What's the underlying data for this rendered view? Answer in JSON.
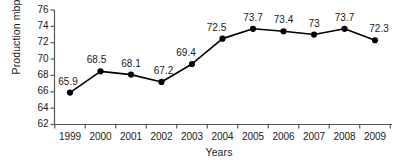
{
  "chart_data": {
    "type": "line",
    "title": "",
    "subtitle": "",
    "xlabel": "Years",
    "ylabel": "Production mbpd",
    "categories": [
      "1999",
      "2000",
      "2001",
      "2002",
      "2003",
      "2004",
      "2005",
      "2006",
      "2007",
      "2008",
      "2009"
    ],
    "values": [
      65.9,
      68.5,
      68.1,
      67.2,
      69.4,
      72.5,
      73.7,
      73.4,
      73,
      73.7,
      72.3
    ],
    "point_labels": [
      "65.9",
      "68.5",
      "68.1",
      "67.2",
      "69.4",
      "72.5",
      "73.7",
      "73.4",
      "73",
      "73.7",
      "72.3"
    ],
    "ylim": [
      62,
      76
    ],
    "ytick_values": [
      62,
      64,
      66,
      68,
      70,
      72,
      74,
      76
    ],
    "ytick_labels": [
      "62",
      "64",
      "66",
      "68",
      "70",
      "72",
      "74",
      "76"
    ],
    "grid": false,
    "legend": null,
    "legend_position": "none",
    "series_color": "#000000",
    "marker": "circle-filled",
    "axis_color": "#555555",
    "background_color": "#ffffff"
  }
}
